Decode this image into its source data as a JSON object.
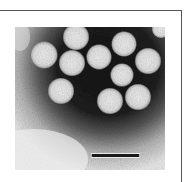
{
  "figure": {
    "type": "electron-micrograph",
    "particle_count_visible": 11,
    "scale_bar": {
      "label": "",
      "color": "#1a1a1a"
    },
    "colors": {
      "background_dark": "#1c1c1c",
      "background_light": "#e8e8e8",
      "particle": "#e4e4e4",
      "frame": "#555555"
    }
  }
}
